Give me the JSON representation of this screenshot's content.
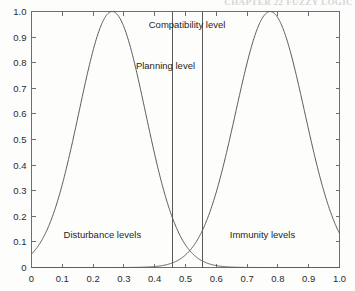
{
  "figure": {
    "running_head": "CHAPTER 22 FUZZY LOGIC",
    "background_color": "#fdfdfc",
    "axis_color": "#6e6e6e",
    "curve_color": "#5a5a5a",
    "text_color": "#1d1d1d"
  },
  "chart_data": {
    "type": "line",
    "title": "",
    "subtitle": "",
    "xlabel": "",
    "ylabel": "",
    "xlim": [
      0,
      1
    ],
    "ylim": [
      0,
      1
    ],
    "grid": false,
    "legend_position": "none",
    "xticks": [
      0,
      0.1,
      0.2,
      0.3,
      0.4,
      0.5,
      0.6,
      0.7,
      0.8,
      0.9,
      1
    ],
    "xtick_labels": [
      "0",
      "0.1",
      "0.2",
      "0.3",
      "0.4",
      "0.5",
      "0.6",
      "0.7",
      "0.8",
      "0.9",
      "1.0"
    ],
    "yticks": [
      0,
      0.1,
      0.2,
      0.3,
      0.4,
      0.5,
      0.6,
      0.7,
      0.8,
      0.9,
      1
    ],
    "ytick_labels": [
      "0",
      "0.1",
      "0.2",
      "0.3",
      "0.4",
      "0.5",
      "0.6",
      "0.7",
      "0.8",
      "0.9",
      "1.0"
    ],
    "series": [
      {
        "name": "Disturbance levels",
        "kind": "gaussian-membership",
        "center": 0.262,
        "sigma": 0.108,
        "peak": 1.0,
        "x": [
          0.0,
          0.05,
          0.1,
          0.15,
          0.2,
          0.25,
          0.262,
          0.3,
          0.35,
          0.4,
          0.45,
          0.5,
          0.55,
          0.6,
          0.65,
          0.7,
          0.8,
          0.9,
          1.0
        ],
        "y": [
          0.051,
          0.127,
          0.264,
          0.461,
          0.694,
          0.987,
          1.0,
          0.925,
          0.706,
          0.458,
          0.256,
          0.123,
          0.051,
          0.018,
          0.006,
          0.002,
          0.0,
          0.0,
          0.0
        ]
      },
      {
        "name": "Immunity levels",
        "kind": "gaussian-membership",
        "center": 0.775,
        "sigma": 0.112,
        "peak": 1.0,
        "x": [
          0.0,
          0.1,
          0.2,
          0.3,
          0.4,
          0.45,
          0.5,
          0.55,
          0.6,
          0.65,
          0.7,
          0.75,
          0.775,
          0.8,
          0.85,
          0.9,
          0.95,
          1.0
        ],
        "y": [
          0.0,
          0.0,
          0.0,
          0.0,
          0.004,
          0.011,
          0.027,
          0.06,
          0.123,
          0.231,
          0.393,
          0.601,
          1.0,
          0.95,
          0.749,
          0.515,
          0.307,
          0.028
        ]
      }
    ],
    "vertical_lines": [
      {
        "name": "planning-level",
        "x": 0.455
      },
      {
        "name": "compatibility-level",
        "x": 0.555
      }
    ],
    "annotations": [
      {
        "name": "compatibility-level-label",
        "text": "Compatibility level",
        "x": 0.505,
        "y": 0.935
      },
      {
        "name": "planning-level-label",
        "text": "Planning level",
        "x": 0.435,
        "y": 0.775
      },
      {
        "name": "disturbance-levels-label",
        "text": "Disturbance levels",
        "x": 0.23,
        "y": 0.115
      },
      {
        "name": "immunity-levels-label",
        "text": "Immunity levels",
        "x": 0.75,
        "y": 0.115
      }
    ]
  }
}
